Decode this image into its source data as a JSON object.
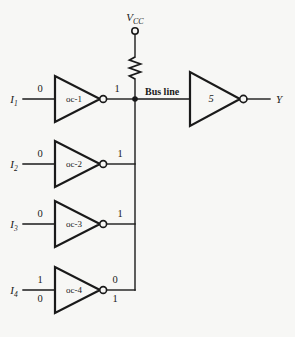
{
  "figure": {
    "type": "open-collector-bus-logic-diagram",
    "background_color": "#f7f7f5",
    "ink_color": "#1a1a1a"
  },
  "power": {
    "label_main": "V",
    "label_sub": "CC",
    "terminal_name": "vcc-terminal",
    "pullup_resistor_name": "pullup-resistor"
  },
  "bus": {
    "label": "Bus line"
  },
  "drivers": [
    {
      "id": "oc-1",
      "gate_label": "oc-1",
      "input_port": "I",
      "input_sub": "1",
      "input_value_top": "0",
      "input_value_bottom": "",
      "output_value_top": "1",
      "output_value_bottom": ""
    },
    {
      "id": "oc-2",
      "gate_label": "oc-2",
      "input_port": "I",
      "input_sub": "2",
      "input_value_top": "0",
      "input_value_bottom": "",
      "output_value_top": "1",
      "output_value_bottom": ""
    },
    {
      "id": "oc-3",
      "gate_label": "oc-3",
      "input_port": "I",
      "input_sub": "3",
      "input_value_top": "0",
      "input_value_bottom": "",
      "output_value_top": "1",
      "output_value_bottom": ""
    },
    {
      "id": "oc-4",
      "gate_label": "oc-4",
      "input_port": "I",
      "input_sub": "4",
      "input_value_top": "1",
      "input_value_bottom": "0",
      "output_value_top": "0",
      "output_value_bottom": "1"
    }
  ],
  "output_stage": {
    "gate_label": "5",
    "output_port": "Y"
  }
}
